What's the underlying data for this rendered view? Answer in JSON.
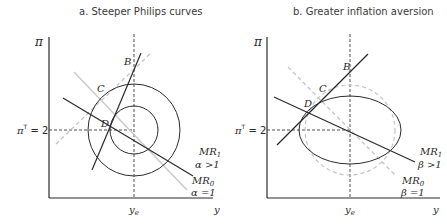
{
  "panels": [
    {
      "title": "a. Steeper Philips curves",
      "y_axis_label": "π",
      "x_axis_label": "y",
      "x_tick": "y",
      "x_tick_sub": "e",
      "y_tick_pre": "π",
      "y_tick_sup": "T",
      "y_tick_post": " = 2",
      "points": {
        "B": "B",
        "C": "C",
        "D": "D"
      },
      "mr1": {
        "name": "MR",
        "sub": "1",
        "param": "α >1"
      },
      "mr0": {
        "name": "MR",
        "sub": "0",
        "param": "α =1"
      }
    },
    {
      "title": "b. Greater inflation aversion",
      "y_axis_label": "π",
      "x_axis_label": "y",
      "x_tick": "y",
      "x_tick_sub": "e",
      "y_tick_pre": "π",
      "y_tick_sup": "T",
      "y_tick_post": " = 2",
      "points": {
        "B": "B",
        "C": "C",
        "D": "D"
      },
      "mr1": {
        "name": "MR",
        "sub": "1",
        "param": "β >1"
      },
      "mr0": {
        "name": "MR",
        "sub": "0",
        "param": "β =1"
      }
    }
  ],
  "colors": {
    "dark": "#2b2b2b",
    "light": "#c8c8c8",
    "dashed": "#3a3a3a"
  }
}
